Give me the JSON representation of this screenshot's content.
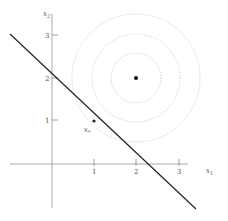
{
  "diagram": {
    "title": "",
    "axes": {
      "x_label": "x",
      "x_label_sub": "1",
      "y_label": "x",
      "y_label_sub": "2",
      "x_ticks": [
        "1",
        "2",
        "3"
      ],
      "y_ticks": [
        "1",
        "2",
        "3"
      ],
      "axis_color": "#aaaaaa"
    },
    "constraint_line": {
      "description": "x1 + x2 = 2",
      "color": "#222222"
    },
    "center_point": {
      "coords": [
        2,
        2
      ],
      "color": "#111111"
    },
    "optimal_point": {
      "label": "x",
      "label_sub": "*",
      "coords": [
        1,
        1
      ],
      "color": "#222222"
    },
    "level_sets": {
      "count": 3,
      "style": "dotted",
      "color": "#c8c8c8"
    }
  }
}
